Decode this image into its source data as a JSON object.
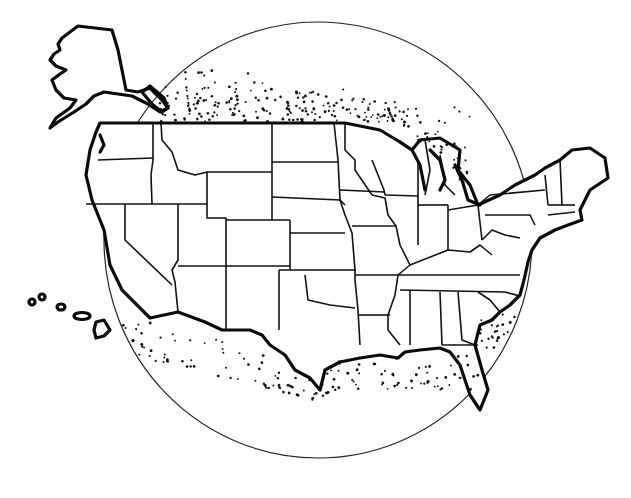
{
  "figure": {
    "colors": {
      "background": "#ffffff",
      "ink": "#111111"
    },
    "circle": {
      "cx": 318,
      "cy": 240,
      "rx": 214,
      "ry": 218
    },
    "regions": [
      {
        "name": "Alaska",
        "type": "inset"
      },
      {
        "name": "Hawaii",
        "type": "inset"
      },
      {
        "name": "Contiguous United States",
        "type": "main"
      }
    ],
    "stipple_zones": [
      "northern border / Great Lakes",
      "Gulf Coast",
      "Pacific Southwest coast",
      "Southeast Atlantic coast"
    ]
  }
}
